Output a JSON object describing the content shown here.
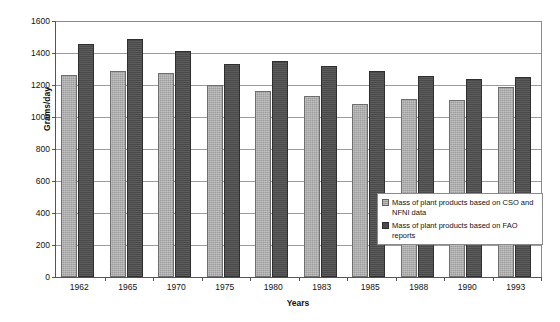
{
  "chart_data": {
    "type": "bar",
    "title": "",
    "xlabel": "Years",
    "ylabel": "Grams/day",
    "ylim": [
      0,
      1600
    ],
    "ytick_step": 200,
    "yticks": [
      0,
      200,
      400,
      600,
      800,
      1000,
      1200,
      1400,
      1600
    ],
    "grid": true,
    "legend_position": "inside-bottom-right",
    "categories": [
      "1962",
      "1965",
      "1970",
      "1975",
      "1980",
      "1983",
      "1985",
      "1988",
      "1990",
      "1993"
    ],
    "series": [
      {
        "name": "Mass of plant products based on CSO and NFNI data",
        "color": "#9d9d9d",
        "values": [
          1265,
          1285,
          1275,
          1200,
          1165,
          1130,
          1080,
          1110,
          1105,
          1190
        ]
      },
      {
        "name": "Mass of plant products based on FAO reports",
        "color": "#4a4a4a",
        "values": [
          1455,
          1490,
          1410,
          1330,
          1350,
          1320,
          1290,
          1255,
          1235,
          1250
        ]
      }
    ]
  },
  "axes": {
    "y_title": "Grams/day",
    "x_title": "Years"
  },
  "legend": {
    "entries": [
      {
        "label": "Mass of plant products based on CSO and NFNI data",
        "swatch": "light-gray-square"
      },
      {
        "label": "Mass of plant products based on FAO reports",
        "swatch": "dark-gray-square"
      }
    ]
  }
}
